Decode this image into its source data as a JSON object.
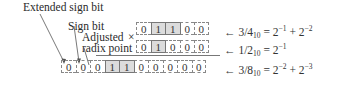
{
  "labels": {
    "extended_sign_bit": "Extended sign bit",
    "sign_bit": "Sign bit",
    "adjusted": "Adjusted",
    "radix_point": "radix point",
    "multiply_symbol": "×"
  },
  "rows": [
    {
      "name": "multiplicand",
      "bits": [
        "0",
        "1",
        "1",
        "0",
        "0"
      ],
      "shaded": [
        1,
        2
      ],
      "value": "3/4",
      "base": "10",
      "equation": " = 2",
      "terms": [
        "−1",
        "−2"
      ]
    },
    {
      "name": "multiplier",
      "bits": [
        "0",
        "1",
        "0",
        "0",
        "0"
      ],
      "shaded": [
        1
      ],
      "value": "1/2",
      "base": "10",
      "equation": " = 2",
      "terms": [
        "−1"
      ]
    },
    {
      "name": "product",
      "bits": [
        "0",
        "0",
        "0",
        "1",
        "1",
        "0",
        "0",
        "0",
        "0",
        "0"
      ],
      "shaded": [
        3,
        4
      ],
      "value": "3/8",
      "base": "10",
      "equation": " = 2",
      "terms": [
        "−2",
        "−3"
      ]
    }
  ],
  "arrow": "←",
  "colors": {
    "shade": "#dcdcdc",
    "line": "#777777",
    "text": "#2a2a2a"
  }
}
